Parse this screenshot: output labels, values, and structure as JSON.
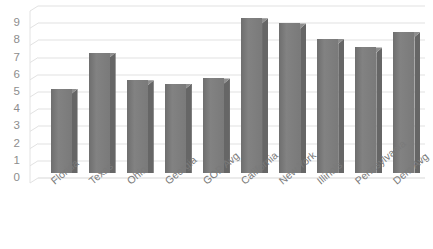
{
  "chart_data": {
    "type": "bar",
    "title": "",
    "subtitle": "",
    "xlabel": "",
    "ylabel": "",
    "categories": [
      "Florida",
      "Texas",
      "Ohio",
      "Georgia",
      "GOP Avg",
      "California",
      "New York",
      "Illinois",
      "Pennsylvania",
      "Dem Avg"
    ],
    "values": [
      4.9,
      7.0,
      5.4,
      5.2,
      5.5,
      9.0,
      8.7,
      7.8,
      7.3,
      8.2
    ],
    "ylim": [
      0,
      10
    ],
    "ytick_labels": [
      "9",
      "8",
      "7",
      "6",
      "5",
      "4",
      "3",
      "2",
      "1",
      "0"
    ],
    "ytick_values": [
      9,
      8,
      7,
      6,
      5,
      4,
      3,
      2,
      1,
      0
    ],
    "grid": true,
    "legend": false,
    "legend_position": "none",
    "style": "3d-column",
    "bar_color": "#7b7b7b",
    "bar_side_color": "#666666",
    "bar_top_color": "#8e8e8e",
    "grid_color": "#e2e2e2",
    "axis_text_color": "#8d8d8d",
    "background_color": "#ffffff"
  }
}
